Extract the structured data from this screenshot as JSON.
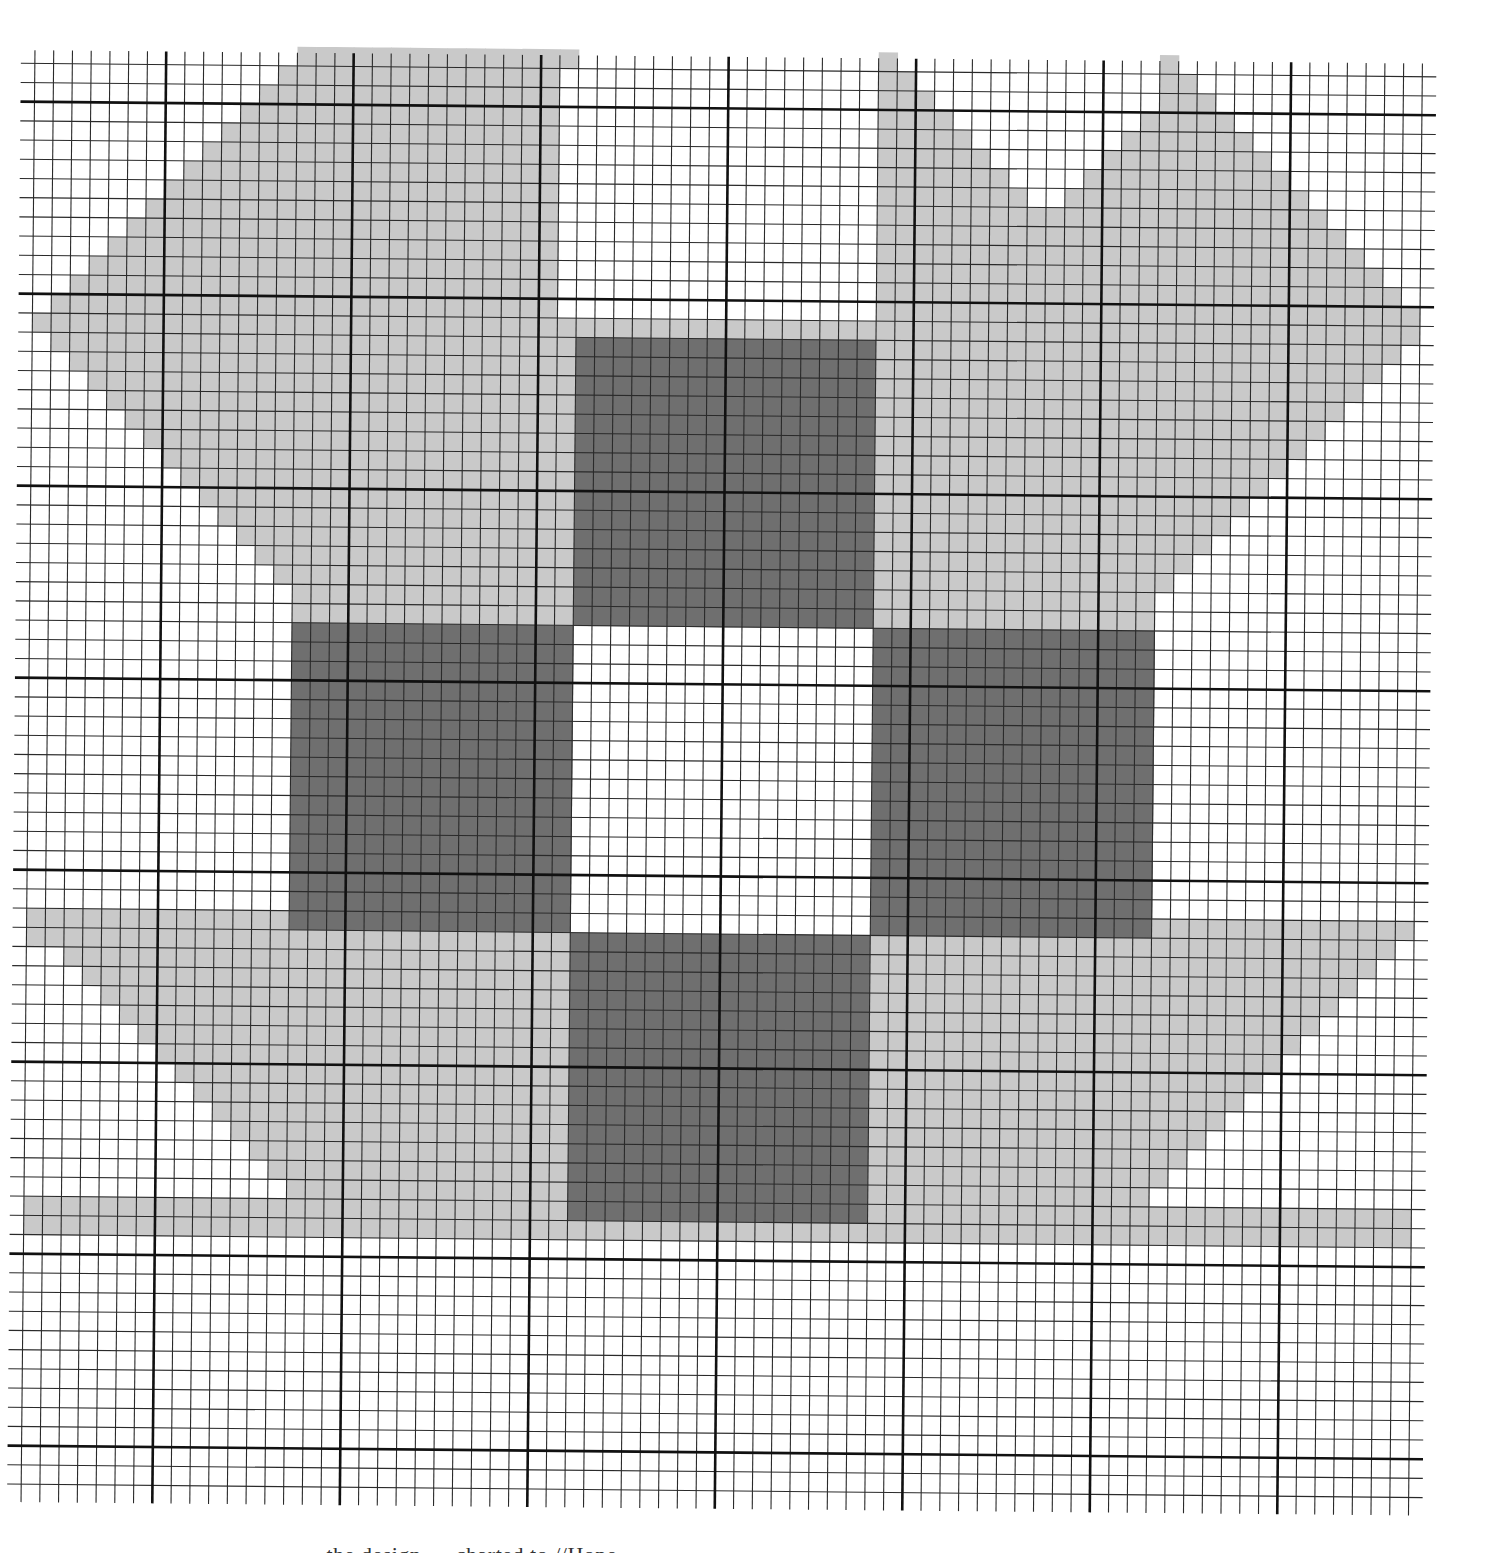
{
  "page": {
    "type": "needlepoint / cross-stitch chart on graph paper",
    "caption_visible_fragment": "… the design … charted to //Hope …",
    "caption_note": "caption text is cut off at bottom edge; only tops of letters visible"
  },
  "grid": {
    "cols": 74,
    "rows_from": -1,
    "rows_to": 74,
    "origin_x": 28,
    "origin_y": 70,
    "cell_w": 18.75,
    "cell_h": 19.2,
    "major_every": 10,
    "major_col_offset": 7,
    "major_row_offset": 2,
    "line_extend_left": 14,
    "line_extend_right": 14,
    "rotation_deg": 0.55,
    "colors": {
      "paper": "#ffffff",
      "minor_line": "#2a2a2a",
      "major_line": "#111111",
      "light": "#c9c9c9",
      "dark": "#6f6f6f"
    }
  },
  "legend": [
    {
      "key": "L",
      "name": "light shade",
      "color": "#c9c9c9"
    },
    {
      "key": "D",
      "name": "dark shade",
      "color": "#6f6f6f"
    },
    {
      "key": ".",
      "name": "unstitched / background",
      "color": "#ffffff"
    }
  ],
  "shapes": [
    {
      "id": "top-left-triangle",
      "shade": "L",
      "kind": "stair",
      "rows": [
        -1,
        12
      ],
      "left": "13-r",
      "right": 14
    },
    {
      "id": "top-mid-triangle",
      "shade": "L",
      "kind": "stair",
      "rows": [
        -1,
        12
      ],
      "left": 14,
      "right": "28-r"
    },
    {
      "id": "top-mid2-triangle",
      "shade": "L",
      "kind": "stair",
      "rows": [
        -1,
        13
      ],
      "left": "27-r",
      "right": 28
    },
    {
      "id": "top-right-a-triangle",
      "shade": "L",
      "kind": "stair",
      "rows": [
        -1,
        13
      ],
      "left": 45,
      "right": "47+r"
    },
    {
      "id": "top-right-b-triangle",
      "shade": "L",
      "kind": "stair",
      "rows": [
        -1,
        13
      ],
      "left": 60,
      "right": "62+r"
    },
    {
      "id": "top-right-c-triangle",
      "shade": "L",
      "kind": "stair",
      "rows": [
        2,
        13
      ],
      "left": "60-r+1",
      "right": 60
    },
    {
      "id": "upper-band",
      "shade": "L",
      "kind": "rect",
      "cols": [
        0,
        74
      ],
      "rows": [
        13,
        13
      ]
    },
    {
      "id": "upper-left-wedge",
      "shade": "L",
      "kind": "stair",
      "rows": [
        14,
        27
      ],
      "left": "r-13",
      "right": 14
    },
    {
      "id": "upper-right-wedge",
      "shade": "L",
      "kind": "stair",
      "rows": [
        14,
        27
      ],
      "left": 60,
      "right": "87-r"
    },
    {
      "id": "center-light-block",
      "shade": "L",
      "kind": "rect",
      "cols": [
        14,
        60
      ],
      "rows": [
        14,
        59
      ]
    },
    {
      "id": "middle-band-left",
      "shade": "L",
      "kind": "rect",
      "cols": [
        0,
        14
      ],
      "rows": [
        44,
        45
      ]
    },
    {
      "id": "middle-band-right",
      "shade": "L",
      "kind": "rect",
      "cols": [
        60,
        74
      ],
      "rows": [
        44,
        44
      ]
    },
    {
      "id": "lower-left-wedge",
      "shade": "L",
      "kind": "stair",
      "rows": [
        46,
        58
      ],
      "left": "r-44",
      "right": 14
    },
    {
      "id": "lower-right-wedge",
      "shade": "L",
      "kind": "stair",
      "rows": [
        45,
        58
      ],
      "left": 60,
      "right": "118-r"
    },
    {
      "id": "lower-band",
      "shade": "L",
      "kind": "rect",
      "cols": [
        0,
        74
      ],
      "rows": [
        59,
        60
      ]
    },
    {
      "id": "bottom-left-triangle",
      "shade": "L",
      "kind": "stair",
      "rows": [
        61,
        74
      ],
      "left": "r-46",
      "right": 14
    },
    {
      "id": "bottom-mid-triangle",
      "shade": "L",
      "kind": "stair",
      "rows": [
        61,
        74
      ],
      "left": "r-46+14",
      "right": 29
    },
    {
      "id": "bottom-mid2-triangle",
      "shade": "L",
      "kind": "stair",
      "rows": [
        61,
        73
      ],
      "left": 45,
      "right": "106-r"
    },
    {
      "id": "bottom-right-triangle",
      "shade": "L",
      "kind": "stair",
      "rows": [
        61,
        73
      ],
      "left": 60,
      "right": "121-r"
    },
    {
      "id": "dark-top",
      "shade": "D",
      "kind": "rect",
      "cols": [
        29,
        45
      ],
      "rows": [
        14,
        28
      ]
    },
    {
      "id": "dark-left",
      "shade": "D",
      "kind": "rect",
      "cols": [
        14,
        29
      ],
      "rows": [
        29,
        44
      ]
    },
    {
      "id": "dark-right",
      "shade": "D",
      "kind": "rect",
      "cols": [
        45,
        60
      ],
      "rows": [
        29,
        44
      ]
    },
    {
      "id": "dark-bottom",
      "shade": "D",
      "kind": "rect",
      "cols": [
        29,
        45
      ],
      "rows": [
        45,
        59
      ]
    },
    {
      "id": "white-center",
      "shade": ".",
      "kind": "rect",
      "cols": [
        29,
        45
      ],
      "rows": [
        29,
        44
      ]
    }
  ]
}
